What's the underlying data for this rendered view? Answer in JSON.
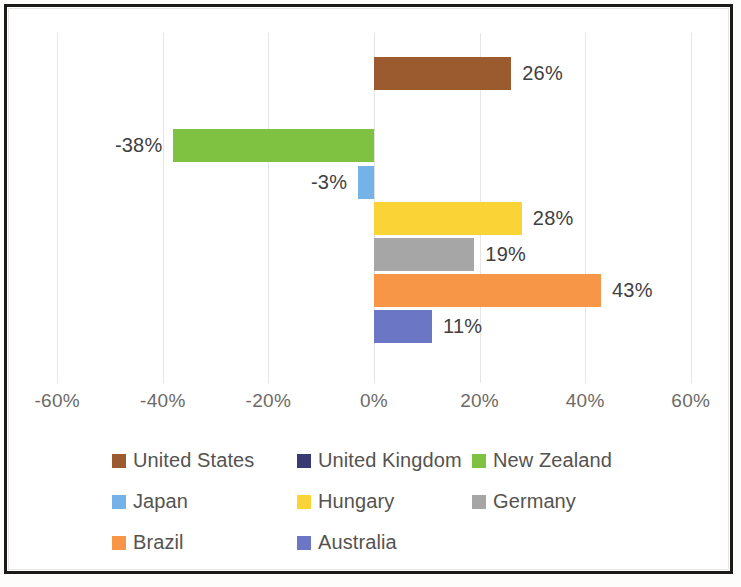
{
  "chart_data": {
    "type": "bar",
    "orientation": "horizontal",
    "title": "",
    "subtitle": "",
    "xlabel": "",
    "ylabel": "",
    "xlim": [
      -60,
      60
    ],
    "xticks": [
      "-60%",
      "-40%",
      "-20%",
      "0%",
      "20%",
      "40%",
      "60%"
    ],
    "xtick_values": [
      -60,
      -40,
      -20,
      0,
      20,
      40,
      60
    ],
    "grid": true,
    "grid_axis": "x",
    "legend_position": "bottom",
    "categories": [
      "United States",
      "United Kingdom",
      "New Zealand",
      "Japan",
      "Hungary",
      "Germany",
      "Brazil",
      "Australia"
    ],
    "values": [
      26,
      0,
      -38,
      -3,
      28,
      19,
      43,
      11
    ],
    "series": [
      {
        "name": "United States",
        "value": 26,
        "label": "26%",
        "color": "#9B5B2E",
        "label_visible": true
      },
      {
        "name": "United Kingdom",
        "value": 0,
        "label": "",
        "color": "#3A3A72",
        "label_visible": false
      },
      {
        "name": "New Zealand",
        "value": -38,
        "label": "-38%",
        "color": "#7FC241",
        "label_visible": true
      },
      {
        "name": "Japan",
        "value": -3,
        "label": "-3%",
        "color": "#75B2E8",
        "label_visible": true
      },
      {
        "name": "Hungary",
        "value": 28,
        "label": "28%",
        "color": "#FAD336",
        "label_visible": true
      },
      {
        "name": "Germany",
        "value": 19,
        "label": "19%",
        "color": "#A6A6A6",
        "label_visible": true
      },
      {
        "name": "Brazil",
        "value": 43,
        "label": "43%",
        "color": "#F79646",
        "label_visible": true
      },
      {
        "name": "Australia",
        "value": 11,
        "label": "11%",
        "color": "#6B76C4",
        "label_visible": true
      }
    ]
  },
  "legend": {
    "rows": [
      [
        {
          "label": "United States",
          "color": "#9B5B2E"
        },
        {
          "label": "United Kingdom",
          "color": "#3A3A72"
        },
        {
          "label": "New Zealand",
          "color": "#7FC241"
        }
      ],
      [
        {
          "label": "Japan",
          "color": "#75B2E8"
        },
        {
          "label": "Hungary",
          "color": "#FAD336"
        },
        {
          "label": "Germany",
          "color": "#A6A6A6"
        }
      ],
      [
        {
          "label": "Brazil",
          "color": "#F79646"
        },
        {
          "label": "Australia",
          "color": "#6B76C4"
        }
      ]
    ]
  },
  "axis": {
    "ticks": [
      {
        "label": "-60%",
        "value": -60
      },
      {
        "label": "-40%",
        "value": -40
      },
      {
        "label": "-20%",
        "value": -20
      },
      {
        "label": "0%",
        "value": 0
      },
      {
        "label": "20%",
        "value": 20
      },
      {
        "label": "40%",
        "value": 40
      },
      {
        "label": "60%",
        "value": 60
      }
    ]
  }
}
